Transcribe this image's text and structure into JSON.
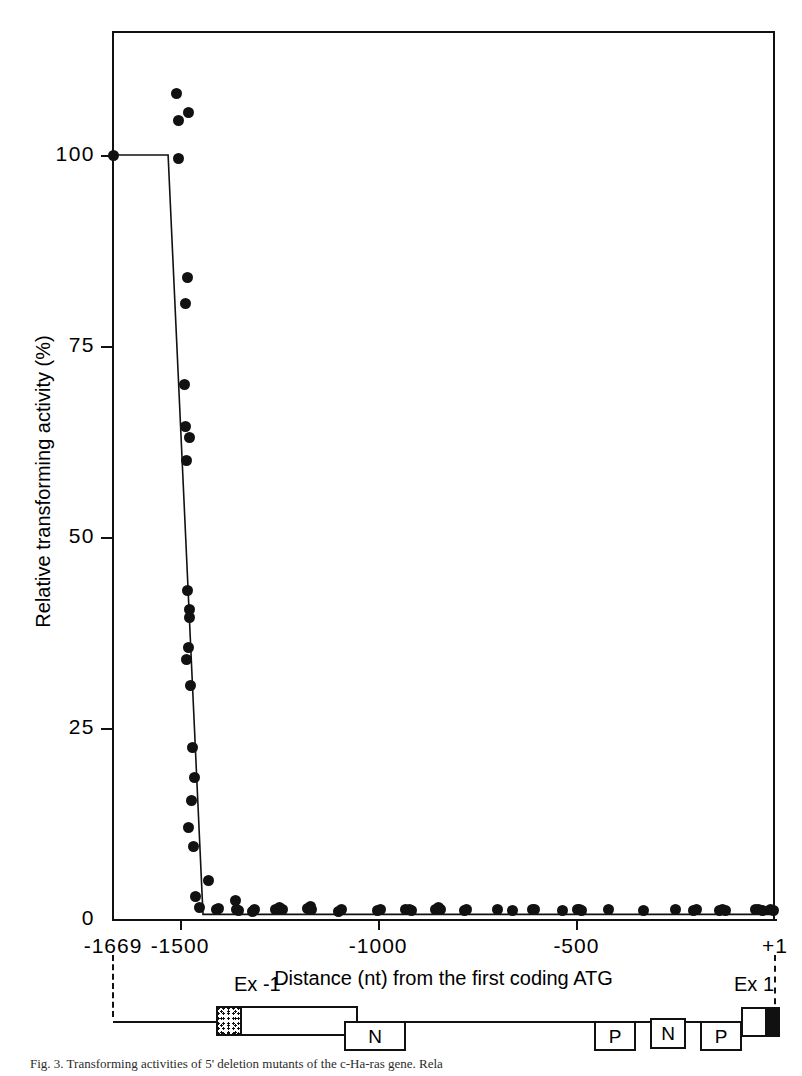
{
  "chart_data": {
    "type": "scatter",
    "title": "",
    "xlabel": "Distance (nt) from the first coding ATG",
    "ylabel": "Relative transforming activity (%)",
    "xlim": [
      -1669,
      1
    ],
    "ylim": [
      0,
      116
    ],
    "grid": false,
    "legend": null,
    "xticks": [
      {
        "value": -1669,
        "label": "-1669"
      },
      {
        "value": -1500,
        "label": "-1500"
      },
      {
        "value": -1000,
        "label": "-1000"
      },
      {
        "value": -500,
        "label": "-500"
      },
      {
        "value": 1,
        "label": "+1"
      }
    ],
    "yticks": [
      {
        "value": 0,
        "label": "0"
      },
      {
        "value": 25,
        "label": "25"
      },
      {
        "value": 50,
        "label": "50"
      },
      {
        "value": 75,
        "label": "75"
      },
      {
        "value": 100,
        "label": "100"
      }
    ],
    "series": [
      {
        "name": "Relative transforming activity",
        "marker": "filled-circle",
        "color": "#111111",
        "points": [
          [
            -1669,
            100
          ],
          [
            -1508,
            108
          ],
          [
            -1505,
            104.5
          ],
          [
            -1503,
            99.5
          ],
          [
            -1479,
            105.5
          ],
          [
            -1482,
            84
          ],
          [
            -1485,
            80.5
          ],
          [
            -1489,
            70
          ],
          [
            -1487,
            64.5
          ],
          [
            -1477,
            63
          ],
          [
            -1483,
            60
          ],
          [
            -1480,
            43
          ],
          [
            -1476,
            39.5
          ],
          [
            -1478,
            35.5
          ],
          [
            -1483,
            34
          ],
          [
            -1477,
            40.5
          ],
          [
            -1474,
            30.5
          ],
          [
            -1469,
            22.5
          ],
          [
            -1464,
            18.5
          ],
          [
            -1470,
            15.5
          ],
          [
            -1478,
            12
          ],
          [
            -1466,
            9.5
          ],
          [
            -1460,
            3
          ],
          [
            -1452,
            1.5
          ],
          [
            -1428,
            5
          ],
          [
            -1408,
            1.2
          ],
          [
            -1402,
            1.4
          ],
          [
            -1360,
            2.4
          ],
          [
            -1357,
            1.3
          ],
          [
            -1352,
            1.1
          ],
          [
            -1318,
            1.0
          ],
          [
            -1312,
            1.2
          ],
          [
            -1258,
            1.2
          ],
          [
            -1250,
            1.5
          ],
          [
            -1242,
            1.2
          ],
          [
            -1178,
            1.4
          ],
          [
            -1172,
            1.6
          ],
          [
            -1168,
            1.2
          ],
          [
            -1099,
            1.0
          ],
          [
            -1092,
            1.3
          ],
          [
            -1002,
            1.1
          ],
          [
            -995,
            1.2
          ],
          [
            -930,
            1.3
          ],
          [
            -922,
            1.2
          ],
          [
            -916,
            1.1
          ],
          [
            -855,
            1.2
          ],
          [
            -848,
            1.5
          ],
          [
            -842,
            1.2
          ],
          [
            -782,
            1.1
          ],
          [
            -776,
            1.3
          ],
          [
            -700,
            1.2
          ],
          [
            -660,
            1.1
          ],
          [
            -612,
            1.2
          ],
          [
            -606,
            1.2
          ],
          [
            -535,
            1.1
          ],
          [
            -498,
            1.2
          ],
          [
            -492,
            1.3
          ],
          [
            -486,
            1.1
          ],
          [
            -420,
            1.2
          ],
          [
            -330,
            1.1
          ],
          [
            -250,
            1.2
          ],
          [
            -205,
            1.1
          ],
          [
            -198,
            1.2
          ],
          [
            -140,
            1.1
          ],
          [
            -132,
            1.2
          ],
          [
            -124,
            1.1
          ],
          [
            -48,
            1.2
          ],
          [
            -40,
            1.2
          ],
          [
            -30,
            1.1
          ],
          [
            -10,
            1.2
          ],
          [
            -4,
            1.1
          ]
        ]
      }
    ],
    "fit_line": {
      "name": "step-fit",
      "color": "#111111",
      "points": [
        [
          -1669,
          100
        ],
        [
          -1530,
          100
        ],
        [
          -1442,
          0.6
        ],
        [
          -1420,
          0.6
        ],
        [
          1,
          0.6
        ]
      ]
    }
  },
  "gene_map": {
    "left_label": "Ex -1",
    "right_label": "Ex 1",
    "boxes": [
      {
        "name": "exon-minus-1",
        "label": ""
      },
      {
        "name": "element-n-1",
        "label": "N"
      },
      {
        "name": "element-p-1",
        "label": "P"
      },
      {
        "name": "element-n-2",
        "label": "N"
      },
      {
        "name": "element-p-2",
        "label": "P"
      },
      {
        "name": "exon-1",
        "label": ""
      }
    ]
  },
  "caption": {
    "text": "Fig. 3.   Transforming activities of 5' deletion mutants of the c-Ha-ras gene. Rela"
  }
}
